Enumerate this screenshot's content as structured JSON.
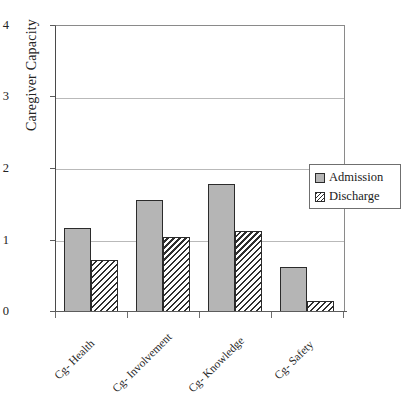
{
  "chart_data": {
    "type": "bar",
    "title": "",
    "xlabel": "",
    "ylabel": "Caregiver Capacity",
    "categories": [
      "Cg- Health",
      "Cg- Involvement",
      "Cg- Knowledge",
      "Cg- Safety"
    ],
    "series": [
      {
        "name": "Admission",
        "values": [
          1.18,
          1.57,
          1.79,
          0.63
        ],
        "color": "#b5b5b5",
        "fill": "solid-gray"
      },
      {
        "name": "Discharge",
        "values": [
          0.73,
          1.05,
          1.13,
          0.15
        ],
        "color": "#2f2f2f",
        "fill": "diagonal-hatch"
      }
    ],
    "ylim": [
      0,
      4
    ],
    "ytick_labels": [
      "0",
      "1",
      "2",
      "3",
      "4"
    ],
    "ytick_values": [
      0,
      1,
      2,
      3,
      4
    ],
    "grid": "horizontal",
    "legend_position": "upper-right-inside",
    "legend_entries": [
      "Admission",
      "Discharge"
    ]
  },
  "axis": {
    "y_title": "Caregiver Capacity",
    "y_ticks": [
      {
        "label": "4",
        "value": 4
      },
      {
        "label": "3",
        "value": 3
      },
      {
        "label": "2",
        "value": 2
      },
      {
        "label": "1",
        "value": 1
      },
      {
        "label": "0",
        "value": 0
      }
    ],
    "x_categories": [
      {
        "label": "Cg- Health"
      },
      {
        "label": "Cg- Involvement"
      },
      {
        "label": "Cg- Knowledge"
      },
      {
        "label": "Cg- Safety"
      }
    ]
  },
  "legend": {
    "items": [
      {
        "label": "Admission",
        "swatch": "solid-gray-swatch"
      },
      {
        "label": "Discharge",
        "swatch": "hatched-swatch"
      }
    ]
  }
}
